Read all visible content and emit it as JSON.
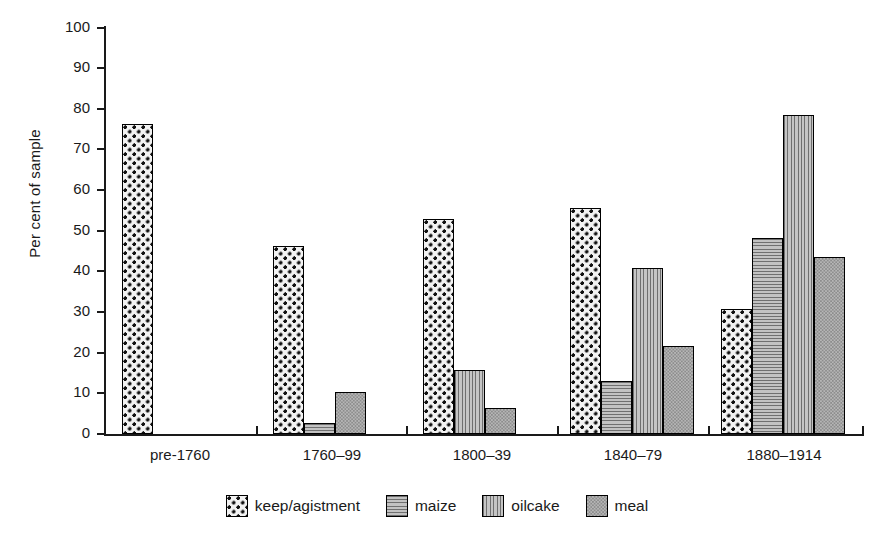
{
  "chart_data": {
    "type": "bar",
    "title": "",
    "xlabel": "",
    "ylabel": "Per cent of sample",
    "ylim": [
      0,
      100
    ],
    "ytick_values": [
      0,
      10,
      20,
      30,
      40,
      50,
      60,
      70,
      80,
      90,
      100
    ],
    "ytick_labels": [
      "0",
      "10",
      "20",
      "30",
      "40",
      "50",
      "60",
      "70",
      "80",
      "90",
      "100"
    ],
    "grid": false,
    "legend_position": "bottom",
    "categories": [
      "pre-1760",
      "1760–99",
      "1800–39",
      "1840–79",
      "1880–1914"
    ],
    "series": [
      {
        "name": "keep/agistment",
        "pattern": "checkered-dots",
        "values": [
          76.2,
          46.3,
          52.8,
          55.5,
          30.8
        ]
      },
      {
        "name": "maize",
        "pattern": "horizontal-lines",
        "values": [
          0,
          2.8,
          0,
          13.0,
          48.2
        ]
      },
      {
        "name": "oilcake",
        "pattern": "vertical-lines",
        "values": [
          0,
          0,
          15.7,
          40.8,
          78.4
        ]
      },
      {
        "name": "meal",
        "pattern": "speckled-gray",
        "values": [
          0,
          10.3,
          6.5,
          21.6,
          43.6
        ]
      }
    ]
  },
  "legend": {
    "items": [
      {
        "label": "keep/agistment",
        "pattern": "keep"
      },
      {
        "label": "maize",
        "pattern": "maize"
      },
      {
        "label": "oilcake",
        "pattern": "oilcake"
      },
      {
        "label": "meal",
        "pattern": "meal"
      }
    ]
  },
  "axes": {
    "y_title": "Per cent of sample"
  }
}
